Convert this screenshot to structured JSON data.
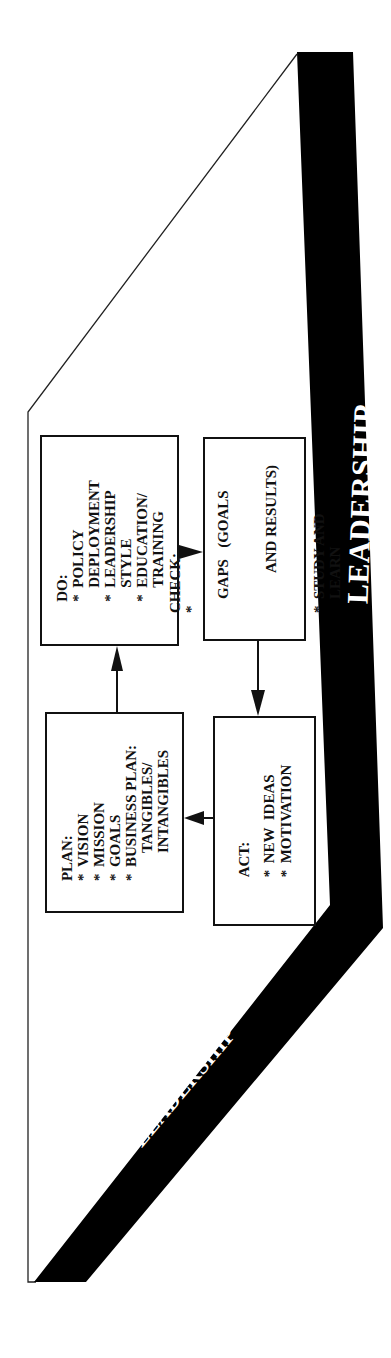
{
  "diagram": {
    "type": "PDCA cycle within leadership frame",
    "band_color": "#000000",
    "line_color": "#111111",
    "band_labels": {
      "right": "LEADERSHIP",
      "bottom_left": "LEADERSHIP"
    },
    "boxes": {
      "plan": {
        "title": "PLAN:",
        "items": [
          {
            "bullet": "*",
            "lines": [
              "VISION"
            ]
          },
          {
            "bullet": "*",
            "lines": [
              "MISSION"
            ]
          },
          {
            "bullet": "*",
            "lines": [
              "GOALS"
            ]
          },
          {
            "bullet": "*",
            "lines": [
              "BUSINESS PLAN:",
              "TANGIBLES/",
              "INTANGIBLES"
            ]
          }
        ]
      },
      "do": {
        "title": "DO:",
        "items": [
          {
            "bullet": "*",
            "lines": [
              "POLICY",
              "DEPLOYMENT"
            ]
          },
          {
            "bullet": "*",
            "lines": [
              "LEADERSHIP",
              "STYLE"
            ]
          },
          {
            "bullet": "*",
            "lines": [
              "EDUCATION/",
              "TRAINING"
            ]
          }
        ]
      },
      "check": {
        "title": "CHECK:",
        "items": [
          {
            "bullet": "*",
            "lines": [
              "GAPS   (GOALS",
              "AND RESULTS)"
            ]
          },
          {
            "bullet": "*",
            "lines": [
              "STUDY AND",
              "LEARN"
            ]
          }
        ]
      },
      "act": {
        "title": "ACT:",
        "items": [
          {
            "bullet": "*",
            "lines": [
              "NEW  IDEAS"
            ]
          },
          {
            "bullet": "*",
            "lines": [
              "MOTIVATION"
            ]
          }
        ]
      }
    },
    "arrows": [
      {
        "from": "plan",
        "to": "do"
      },
      {
        "from": "do",
        "to": "check"
      },
      {
        "from": "check",
        "to": "act"
      },
      {
        "from": "act",
        "to": "plan"
      }
    ]
  }
}
